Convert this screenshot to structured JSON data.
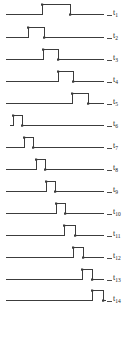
{
  "figure": {
    "type": "timing-diagram",
    "stroke_color": "#3c3c3c",
    "label_color": "#1a1a1a",
    "background": "#ffffff",
    "width": 128,
    "height": 338
  },
  "chart_data": {
    "type": "line",
    "title": "",
    "xlabel": "",
    "ylabel": "",
    "grid": false,
    "legend": "right",
    "series": [
      {
        "name": "t1",
        "label": "t",
        "subscript": "1",
        "pulse_start": 42,
        "pulse_end": 70,
        "baseline_start": 6,
        "baseline_end": 104
      },
      {
        "name": "t2",
        "label": "t",
        "subscript": "2",
        "pulse_start": 28,
        "pulse_end": 44,
        "baseline_start": 6,
        "baseline_end": 104
      },
      {
        "name": "t3",
        "label": "t",
        "subscript": "3",
        "pulse_start": 43,
        "pulse_end": 58,
        "baseline_start": 6,
        "baseline_end": 104
      },
      {
        "name": "t4",
        "label": "t",
        "subscript": "4",
        "pulse_start": 58,
        "pulse_end": 73,
        "baseline_start": 6,
        "baseline_end": 104
      },
      {
        "name": "t5",
        "label": "t",
        "subscript": "5",
        "pulse_start": 72,
        "pulse_end": 88,
        "baseline_start": 6,
        "baseline_end": 104
      },
      {
        "name": "t6",
        "label": "t",
        "subscript": "6",
        "pulse_start": 13,
        "pulse_end": 22,
        "baseline_start": 10,
        "baseline_end": 104
      },
      {
        "name": "t7",
        "label": "t",
        "subscript": "7",
        "pulse_start": 24,
        "pulse_end": 33,
        "baseline_start": 6,
        "baseline_end": 104
      },
      {
        "name": "t8",
        "label": "t",
        "subscript": "8",
        "pulse_start": 36,
        "pulse_end": 45,
        "baseline_start": 6,
        "baseline_end": 104
      },
      {
        "name": "t9",
        "label": "t",
        "subscript": "9",
        "pulse_start": 46,
        "pulse_end": 55,
        "baseline_start": 6,
        "baseline_end": 104
      },
      {
        "name": "t10",
        "label": "t",
        "subscript": "10",
        "pulse_start": 56,
        "pulse_end": 65,
        "baseline_start": 6,
        "baseline_end": 104
      },
      {
        "name": "t11",
        "label": "t",
        "subscript": "11",
        "pulse_start": 64,
        "pulse_end": 75,
        "baseline_start": 6,
        "baseline_end": 104
      },
      {
        "name": "t12",
        "label": "t",
        "subscript": "12",
        "pulse_start": 73,
        "pulse_end": 83,
        "baseline_start": 6,
        "baseline_end": 104
      },
      {
        "name": "t13",
        "label": "t",
        "subscript": "13",
        "pulse_start": 82,
        "pulse_end": 92,
        "baseline_start": 6,
        "baseline_end": 104
      },
      {
        "name": "t14",
        "label": "t",
        "subscript": "14",
        "pulse_start": 92,
        "pulse_end": 103,
        "baseline_start": 6,
        "baseline_end": 106
      }
    ],
    "row_tops": [
      14,
      37,
      59,
      81,
      103,
      125,
      147,
      169,
      191,
      213,
      235,
      257,
      279,
      300
    ],
    "label_x": 113,
    "pulse_height": 11
  }
}
